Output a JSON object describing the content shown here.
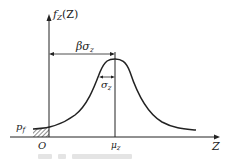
{
  "diagram": {
    "y_axis_label": "f",
    "y_axis_sub": "Z",
    "y_axis_arg": "(Z)",
    "x_axis_label": "Z",
    "origin_label": "O",
    "mean_label": "μ",
    "mean_sub": "z",
    "beta_label": "βσ",
    "beta_sub": "z",
    "sigma_label": "σ",
    "sigma_sub": "z",
    "failure_prob_label": "p",
    "failure_prob_sub": "f",
    "caption": "",
    "colors": {
      "line": "#222222",
      "caption": "#e4e4e4"
    }
  }
}
